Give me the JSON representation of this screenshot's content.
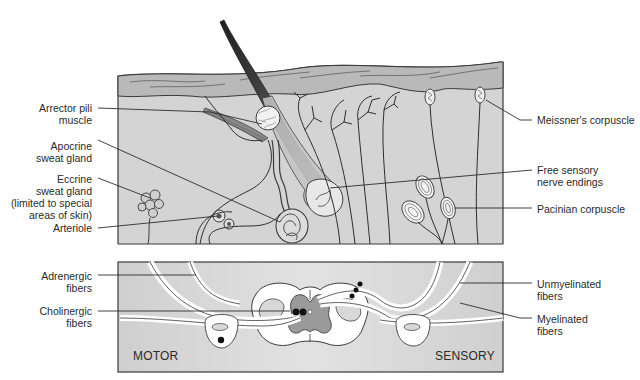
{
  "figure": {
    "top_panel": {
      "name": "skin-cross-section",
      "left_labels": [
        {
          "id": "arrector",
          "lines": [
            "Arrector pili",
            "muscle"
          ]
        },
        {
          "id": "apocrine",
          "lines": [
            "Apocrine",
            "sweat gland"
          ]
        },
        {
          "id": "eccrine",
          "lines": [
            "Eccrine",
            "sweat gland",
            "(limited to special",
            "areas of skin)"
          ]
        },
        {
          "id": "arteriole",
          "lines": [
            "Arteriole"
          ]
        }
      ],
      "right_labels": [
        {
          "id": "meissner",
          "lines": [
            "Meissner's corpuscle"
          ]
        },
        {
          "id": "free_endings",
          "lines": [
            "Free sensory",
            "nerve endings"
          ]
        },
        {
          "id": "pacinian",
          "lines": [
            "Pacinian corpuscle"
          ]
        }
      ]
    },
    "bottom_panel": {
      "name": "spinal-cord-section",
      "left_labels": [
        {
          "id": "adrenergic",
          "lines": [
            "Adrenergic",
            "fibers"
          ]
        },
        {
          "id": "cholinergic",
          "lines": [
            "Cholinergic",
            "fibers"
          ]
        }
      ],
      "right_labels": [
        {
          "id": "unmyelinated",
          "lines": [
            "Unmyelinated",
            "fibers"
          ]
        },
        {
          "id": "myelinated",
          "lines": [
            "Myelinated",
            "fibers"
          ]
        }
      ],
      "corner_labels": {
        "motor": "MOTOR",
        "sensory": "SENSORY"
      }
    },
    "colors": {
      "tissue_fill": "#d4d4d4",
      "epidermis_fill": "#b9b9b9",
      "outline": "#3a3a3a",
      "hair_dark": "#2e2e2e",
      "white_matter": "#ffffff",
      "gray_matter": "#9a9a9a"
    }
  }
}
